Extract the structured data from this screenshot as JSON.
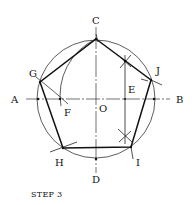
{
  "diagram": {
    "title": "STEP 3",
    "colors": {
      "stroke": "#1a1a1a",
      "background": "#ffffff"
    },
    "labels": {
      "A": "A",
      "B": "B",
      "C": "C",
      "D": "D",
      "E": "E",
      "F": "F",
      "G": "G",
      "H": "H",
      "I": "I",
      "J": "J",
      "O": "O"
    },
    "pentagon_vertices": [
      "C",
      "J",
      "I",
      "H",
      "G"
    ]
  }
}
